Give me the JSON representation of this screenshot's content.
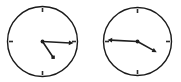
{
  "canvas": {
    "width": 181,
    "height": 82,
    "background_color": "#ffffff",
    "title": "two analog clock faces"
  },
  "style": {
    "dial_stroke_color": "#1a1a1a",
    "dial_fill_color": "#ffffff",
    "dial_stroke_width": 1.4,
    "tick_color": "#2b2b2b",
    "tick_width": 1.6,
    "tick_length": 4,
    "hand_color": "#1f1f1f",
    "minute_hand_width": 1.6,
    "hour_hand_width": 1.6
  },
  "clocks": [
    {
      "id": "clock-left",
      "name": "left-clock",
      "label": "left analog clock",
      "center_x": 42.5,
      "center_y": 41.5,
      "radius": 35,
      "ticks": [
        {
          "name": "tick-12",
          "angle_deg": 0,
          "position": "12"
        },
        {
          "name": "tick-3",
          "angle_deg": 90,
          "position": "3"
        },
        {
          "name": "tick-6",
          "angle_deg": 180,
          "position": "6"
        },
        {
          "name": "tick-9",
          "angle_deg": 270,
          "position": "9"
        }
      ],
      "minute_hand": {
        "name": "minute-hand",
        "angle_deg": 93,
        "length": 31,
        "tip_style": "arrow"
      },
      "hour_hand": {
        "name": "hour-hand",
        "angle_deg": 146,
        "length": 19,
        "tip_style": "dot"
      },
      "reading": "approximately 4:16"
    },
    {
      "id": "clock-right",
      "name": "right-clock",
      "label": "right analog clock",
      "center_x": 137.5,
      "center_y": 41.5,
      "radius": 34,
      "ticks": [
        {
          "name": "tick-12",
          "angle_deg": 0,
          "position": "12"
        },
        {
          "name": "tick-3",
          "angle_deg": 90,
          "position": "3"
        },
        {
          "name": "tick-6",
          "angle_deg": 180,
          "position": "6"
        },
        {
          "name": "tick-9",
          "angle_deg": 270,
          "position": "9"
        }
      ],
      "minute_hand": {
        "name": "minute-hand",
        "angle_deg": 273,
        "length": 30,
        "tip_style": "arrow"
      },
      "hour_hand": {
        "name": "hour-hand",
        "angle_deg": 119,
        "length": 22,
        "tip_style": "arrow"
      },
      "reading": "approximately 4:45"
    }
  ]
}
